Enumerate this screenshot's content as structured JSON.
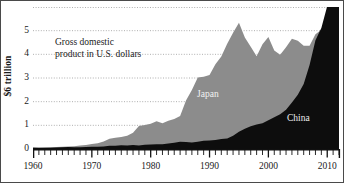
{
  "chart_data": {
    "type": "area",
    "title": "",
    "annotation": "Gross domestic\nproduct in U.S. dollars",
    "annotation_line1": "Gross domestic",
    "annotation_line2": "product in U.S. dollars",
    "ylabel": "$6 trillion",
    "xlabel": "",
    "xlim": [
      1960,
      2012
    ],
    "ylim": [
      0,
      6
    ],
    "grid": true,
    "grid_style": "dotted-horizontal",
    "legend_position": "inline-labels",
    "yticks": [
      0,
      1,
      2,
      3,
      4,
      5
    ],
    "ytick_labels": [
      "0",
      "1",
      "2",
      "3",
      "4",
      "5"
    ],
    "xticks": [
      1960,
      1970,
      1980,
      1990,
      2000,
      2010
    ],
    "xtick_labels": [
      "1960",
      "1970",
      "1980",
      "1990",
      "2000",
      "2010"
    ],
    "xtick_minor_interval": 1,
    "units": "trillions of U.S. dollars",
    "colors": {
      "japan": "#8c8c8c",
      "china": "#0d0d0d",
      "background": "#ffffff",
      "axis": "#111111",
      "grid": "#9a9a9a"
    },
    "series": [
      {
        "name": "Japan",
        "color": "#8c8c8c",
        "x": [
          1960,
          1961,
          1962,
          1963,
          1964,
          1965,
          1966,
          1967,
          1968,
          1969,
          1970,
          1971,
          1972,
          1973,
          1974,
          1975,
          1976,
          1977,
          1978,
          1979,
          1980,
          1981,
          1982,
          1983,
          1984,
          1985,
          1986,
          1987,
          1988,
          1989,
          1990,
          1991,
          1992,
          1993,
          1994,
          1995,
          1996,
          1997,
          1998,
          1999,
          2000,
          2001,
          2002,
          2003,
          2004,
          2005,
          2006,
          2007,
          2008,
          2009,
          2010,
          2011,
          2012
        ],
        "values": [
          0.04,
          0.05,
          0.06,
          0.07,
          0.08,
          0.09,
          0.11,
          0.12,
          0.15,
          0.17,
          0.21,
          0.24,
          0.32,
          0.43,
          0.48,
          0.51,
          0.56,
          0.69,
          0.97,
          1.01,
          1.07,
          1.17,
          1.09,
          1.19,
          1.27,
          1.39,
          2.05,
          2.49,
          3.02,
          3.05,
          3.13,
          3.58,
          3.91,
          4.45,
          4.91,
          5.33,
          4.71,
          4.32,
          3.92,
          4.43,
          4.73,
          4.16,
          3.98,
          4.3,
          4.66,
          4.57,
          4.36,
          4.36,
          4.85,
          5.04,
          5.5,
          5.9,
          5.95
        ]
      },
      {
        "name": "China",
        "color": "#0d0d0d",
        "x": [
          1960,
          1961,
          1962,
          1963,
          1964,
          1965,
          1966,
          1967,
          1968,
          1969,
          1970,
          1971,
          1972,
          1973,
          1974,
          1975,
          1976,
          1977,
          1978,
          1979,
          1980,
          1981,
          1982,
          1983,
          1984,
          1985,
          1986,
          1987,
          1988,
          1989,
          1990,
          1991,
          1992,
          1993,
          1994,
          1995,
          1996,
          1997,
          1998,
          1999,
          2000,
          2001,
          2002,
          2003,
          2004,
          2005,
          2006,
          2007,
          2008,
          2009,
          2010,
          2011,
          2012
        ],
        "values": [
          0.06,
          0.05,
          0.05,
          0.05,
          0.06,
          0.07,
          0.08,
          0.07,
          0.07,
          0.08,
          0.09,
          0.1,
          0.11,
          0.14,
          0.14,
          0.16,
          0.15,
          0.17,
          0.15,
          0.18,
          0.19,
          0.2,
          0.2,
          0.23,
          0.26,
          0.31,
          0.3,
          0.27,
          0.31,
          0.35,
          0.36,
          0.38,
          0.42,
          0.44,
          0.56,
          0.73,
          0.86,
          0.96,
          1.03,
          1.09,
          1.21,
          1.34,
          1.47,
          1.66,
          1.96,
          2.29,
          2.75,
          3.55,
          4.59,
          5.11,
          6.04,
          7.55,
          8.53
        ]
      }
    ]
  },
  "axis": {
    "ylabel": "$6 trillion",
    "ytick_labels": [
      "5",
      "4",
      "3",
      "2",
      "1",
      "0"
    ],
    "xtick_labels": [
      "1960",
      "1970",
      "1980",
      "1990",
      "2000",
      "2010"
    ]
  },
  "labels": {
    "japan": "Japan",
    "china": "China",
    "annotation_line1": "Gross domestic",
    "annotation_line2": "product in U.S. dollars"
  }
}
